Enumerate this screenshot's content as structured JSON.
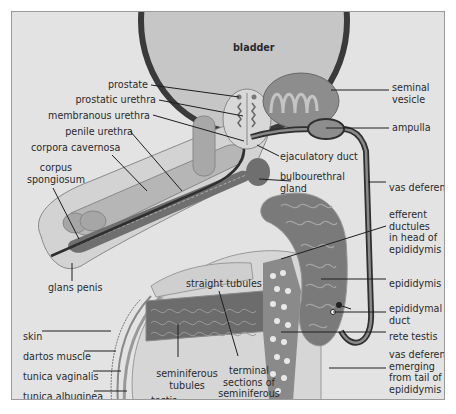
{
  "diagram": {
    "colors": {
      "background": "#e3e3e3",
      "tissue_light": "#c8c8c8",
      "tissue_mid": "#a9a9a9",
      "tissue_dark": "#6e6e6e",
      "duct": "#2f2f2f",
      "outline": "#8a8a8a"
    },
    "labels": {
      "bladder": "bladder",
      "prostate": "prostate",
      "prostatic_urethra": "prostatic urethra",
      "membranous_urethra": "membranous urethra",
      "penile_urethra": "penile urethra",
      "corpora_cavernosa": "corpora cavernosa",
      "corpus_spongiosum": "corpus\nspongiosum",
      "glans_penis": "glans penis",
      "seminal_vesicle": "seminal\nvesicle",
      "ampulla": "ampulla",
      "ejaculatory_duct": "ejaculatory duct",
      "bulbourethral_gland": "bulbourethral\ngland",
      "vas_deferens": "vas deferens",
      "efferent_ductules": "efferent\nductules\nin head of\nepididymis",
      "epididymis": "epididymis",
      "epididymal_duct": "epididymal\nduct",
      "rete_testis": "rete testis",
      "vas_deferens_emerging": "vas deferens\nemerging\nfrom tail of\nepididymis",
      "straight_tubules": "straight tubules",
      "seminiferous_tubules": "seminiferous\ntubules",
      "terminal_sections": "terminal\nsections of\nseminiferous\ntubules",
      "skin": "skin",
      "dartos_muscle": "dartos muscle",
      "tunica_vaginalis": "tunica vaginalis",
      "tunica_albuginea": "tunica albuginea",
      "testis": "testis"
    }
  }
}
